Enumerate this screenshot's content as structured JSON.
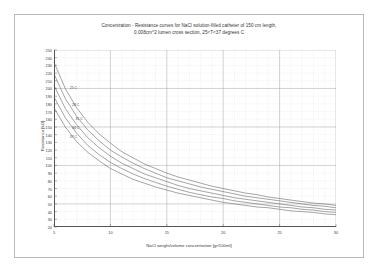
{
  "chart_data": {
    "type": "line",
    "title": "Concentration - Resistance curves for NaCl solution-filled catheter of 150 cm length,",
    "subtitle": "0.008cm^2 lumen cross section, 25<T<37 degrees C",
    "xlabel": "NaCl weight/volume concentration [gr/100ml]",
    "ylabel": "Resistance [kO]",
    "xlim": [
      5,
      30
    ],
    "ylim": [
      20,
      250
    ],
    "xticks": [
      5,
      10,
      15,
      20,
      25,
      30
    ],
    "yticks": [
      20,
      30,
      40,
      50,
      60,
      70,
      80,
      90,
      100,
      110,
      120,
      130,
      140,
      150,
      160,
      170,
      180,
      190,
      200,
      210,
      220,
      230,
      240,
      250
    ],
    "xtick_labels": [
      "5",
      "10",
      "15",
      "20",
      "25",
      "30"
    ],
    "ytick_labels": [
      "20",
      "30",
      "40",
      "50",
      "60",
      "70",
      "80",
      "90",
      "100",
      "110",
      "120",
      "130",
      "140",
      "150",
      "160",
      "170",
      "180",
      "190",
      "200",
      "210",
      "220",
      "230",
      "240",
      "250"
    ],
    "grid": true,
    "grid_minor": true,
    "legend_position": "inline-left",
    "x": [
      5,
      6,
      7,
      8,
      9,
      10,
      11,
      12,
      13,
      14,
      15,
      16,
      17,
      18,
      19,
      20,
      21,
      22,
      23,
      24,
      25,
      26,
      27,
      28,
      29,
      30
    ],
    "series": [
      {
        "name": "25 deg C",
        "label": "25 C",
        "values": [
          234,
          200,
          175,
          156,
          141,
          129,
          118,
          110,
          102,
          96,
          90,
          85,
          81,
          77,
          73,
          70,
          67,
          64,
          62,
          59,
          57,
          55,
          53,
          51,
          50,
          48
        ]
      },
      {
        "name": "28 deg C",
        "label": "28 C",
        "values": [
          219,
          187,
          164,
          146,
          132,
          120,
          111,
          103,
          96,
          90,
          84,
          80,
          76,
          72,
          69,
          66,
          63,
          60,
          58,
          56,
          54,
          52,
          50,
          48,
          47,
          45
        ]
      },
      {
        "name": "31 deg C",
        "label": "31 C",
        "values": [
          204,
          174,
          153,
          136,
          123,
          112,
          103,
          96,
          89,
          84,
          79,
          74,
          70,
          67,
          64,
          61,
          58,
          56,
          54,
          52,
          50,
          48,
          46,
          45,
          43,
          42
        ]
      },
      {
        "name": "34 deg C",
        "label": "34 C",
        "values": [
          189,
          162,
          142,
          126,
          114,
          104,
          96,
          89,
          83,
          78,
          73,
          69,
          65,
          62,
          59,
          57,
          54,
          52,
          50,
          48,
          46,
          45,
          43,
          42,
          40,
          39
        ]
      },
      {
        "name": "37 deg C",
        "label": "37 C",
        "values": [
          175,
          150,
          131,
          117,
          106,
          96,
          89,
          82,
          77,
          72,
          68,
          64,
          61,
          58,
          55,
          52,
          50,
          48,
          46,
          45,
          43,
          41,
          40,
          39,
          37,
          36
        ]
      }
    ],
    "curve_label_points": [
      {
        "series": 0,
        "x": 6.4,
        "y": 200
      },
      {
        "series": 1,
        "x": 6.6,
        "y": 178
      },
      {
        "series": 2,
        "x": 6.9,
        "y": 160
      },
      {
        "series": 3,
        "x": 6.6,
        "y": 148
      },
      {
        "series": 4,
        "x": 6.4,
        "y": 137
      }
    ],
    "colors": {
      "line": "#5a5a5a",
      "grid_major": "#9a9a9a",
      "grid_minor": "#d8d8d8",
      "axis": "#555555",
      "text": "#3b3b3b"
    }
  }
}
